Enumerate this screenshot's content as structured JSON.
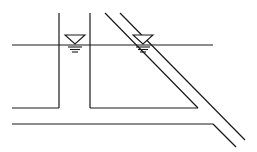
{
  "diagram": {
    "type": "hydraulic-cross-section",
    "stroke_color": "#1a1a1a",
    "background": "#ffffff",
    "width": 257,
    "height": 152,
    "water_level_line": {
      "x1": 12,
      "y1": 45,
      "x2": 213,
      "y2": 45
    },
    "vertical_pipe": {
      "left_wall_x": 59,
      "right_wall_x": 90,
      "top_y": 13,
      "bottom_y": 108
    },
    "upper_floor_left": {
      "x1": 12,
      "y1": 108,
      "x2": 59,
      "y2": 108
    },
    "upper_floor_right": {
      "x1": 90,
      "y1": 108,
      "x2": 198,
      "y2": 108
    },
    "inclined_pipe_inner": {
      "x1": 105,
      "y1": 13,
      "x2": 198,
      "y2": 108
    },
    "inclined_pipe_outer": {
      "x1": 120,
      "y1": 13,
      "x2": 245,
      "y2": 140
    },
    "lower_floor": {
      "x1": 12,
      "y1": 124,
      "x2": 213,
      "y2": 124
    },
    "lower_floor_bend": {
      "x1": 213,
      "y1": 124,
      "x2": 236,
      "y2": 147
    },
    "water_symbols": [
      {
        "name": "water-level-symbol-vertical",
        "cx": 75,
        "top_y": 35
      },
      {
        "name": "water-level-symbol-inclined",
        "cx": 143,
        "top_y": 35
      }
    ]
  }
}
